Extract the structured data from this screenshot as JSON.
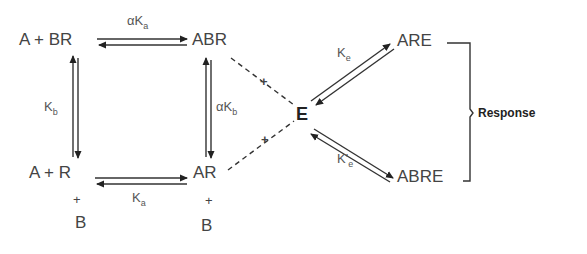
{
  "diagram": {
    "type": "receptor-activation-scheme",
    "nodes": {
      "a_plus_br": "A + BR",
      "abr": "ABR",
      "a_plus_r": "A + R",
      "ar": "AR",
      "e": "E",
      "are": "ARE",
      "abre": "ABRE",
      "b_under_r": "B",
      "b_under_ar": "B",
      "plus_under_r": "+",
      "plus_under_ar": "+"
    },
    "constants": {
      "top": {
        "prefix": "α",
        "base": "K",
        "sub": "a"
      },
      "bottom": {
        "prefix": "",
        "base": "K",
        "sub": "a"
      },
      "left": {
        "prefix": "",
        "base": "K",
        "sub": "b"
      },
      "right": {
        "prefix": "α",
        "base": "K",
        "sub": "b"
      },
      "upper_e": {
        "prefix": "",
        "base": "K",
        "sub": "e"
      },
      "lower_e": {
        "prefix": "",
        "base": "K'",
        "sub": "e"
      }
    },
    "dashed_plus_upper": "+",
    "dashed_plus_lower": "+",
    "response_label": "Response",
    "edges": [
      {
        "from": "A + BR",
        "to": "ABR",
        "type": "equilibrium",
        "constant": "αKa"
      },
      {
        "from": "A + R",
        "to": "AR",
        "type": "equilibrium",
        "constant": "Ka"
      },
      {
        "from": "A + BR",
        "to": "A + R",
        "type": "equilibrium",
        "constant": "Kb"
      },
      {
        "from": "ABR",
        "to": "AR",
        "type": "equilibrium",
        "constant": "αKb"
      },
      {
        "from": "ABR",
        "to": "E",
        "type": "dashed",
        "label": "+"
      },
      {
        "from": "AR",
        "to": "E",
        "type": "dashed",
        "label": "+"
      },
      {
        "from": "E",
        "to": "ARE",
        "type": "equilibrium",
        "constant": "Ke"
      },
      {
        "from": "E",
        "to": "ABRE",
        "type": "equilibrium",
        "constant": "K'e"
      },
      {
        "from": [
          "ARE",
          "ABRE"
        ],
        "to": "Response",
        "type": "bracket"
      }
    ]
  },
  "colors": {
    "line": "#333333",
    "text": "#444444",
    "background": "#ffffff"
  }
}
